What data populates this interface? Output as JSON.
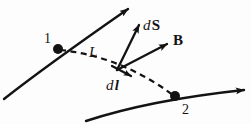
{
  "figure": {
    "kind": "physics-vector-diagram",
    "width": 251,
    "height": 124,
    "background_color": "#fdfdfd",
    "ink_color": "#131313",
    "labels": {
      "point_1": "1",
      "point_2": "2",
      "curve_L": "L",
      "vector_dS_d": "d",
      "vector_dS_S": "S",
      "vector_B": "B",
      "vector_dl_d": "d",
      "vector_dl_l": "l"
    },
    "geometry": {
      "point_1": {
        "x": 58,
        "y": 49,
        "radius": 5
      },
      "point_2": {
        "x": 175,
        "y": 96,
        "radius": 5
      },
      "vector_origin": {
        "x": 117,
        "y": 70
      },
      "solid_curve_top": {
        "start": {
          "x": 4,
          "y": 96
        },
        "end": {
          "x": 131,
          "y": 6
        },
        "has_arrowhead_at_end": true
      },
      "solid_curve_bottom": {
        "start": {
          "x": 86,
          "y": 120
        },
        "end": {
          "x": 247,
          "y": 90
        },
        "has_arrowhead_at_end": true
      },
      "dashed_curve": {
        "start": {
          "x": 58,
          "y": 49
        },
        "control": {
          "x": 118,
          "y": 58
        },
        "end": {
          "x": 175,
          "y": 96
        },
        "dash_pattern": "6 4"
      },
      "vector_dS": {
        "tip": {
          "x": 141,
          "y": 23
        }
      },
      "vector_B": {
        "tip": {
          "x": 170,
          "y": 42
        }
      },
      "vector_dl": {
        "tip": {
          "x": 134,
          "y": 78
        }
      }
    }
  }
}
